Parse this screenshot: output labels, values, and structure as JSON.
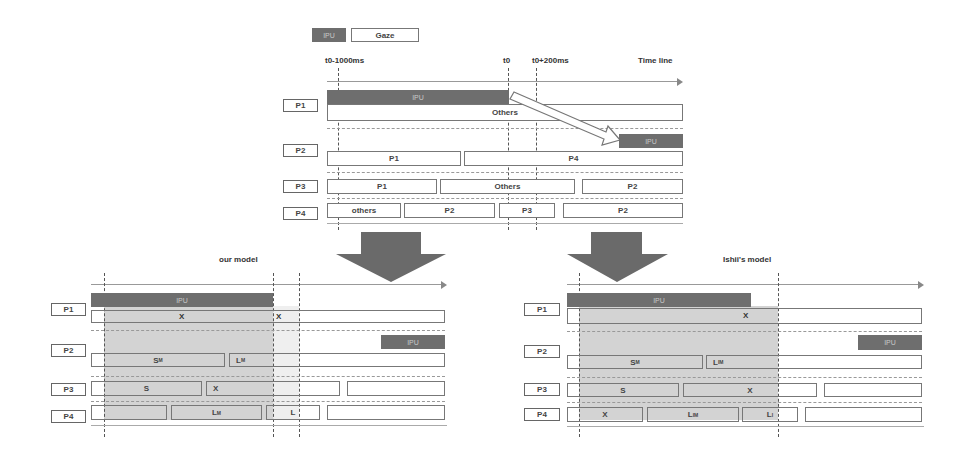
{
  "legend": {
    "ipu_label": "IPU",
    "gaze_label": "Gaze",
    "ipu_color": "#6e6e6e"
  },
  "top": {
    "time_labels": {
      "t_minus": "t0-1000ms",
      "t0": "t0",
      "t_plus": "t0+200ms",
      "timeline": "Time line"
    },
    "participants": [
      "P1",
      "P2",
      "P3",
      "P4"
    ],
    "ipu_label": "IPU",
    "rows": {
      "p1": [
        "Others"
      ],
      "p2": [
        "P1",
        "P4"
      ],
      "p3": [
        "P1",
        "Others",
        "P2"
      ],
      "p4": [
        "others",
        "P2",
        "P3",
        "P2"
      ]
    }
  },
  "our_model": {
    "title": "our model",
    "participants": [
      "P1",
      "P2",
      "P3",
      "P4"
    ],
    "ipu_label": "IPU",
    "rows": {
      "p1": [
        "X",
        "X"
      ],
      "p2": {
        "a": "S",
        "a_sub": "M",
        "b": "L",
        "b_sub": "M"
      },
      "p3": [
        "S",
        "X"
      ],
      "p4": {
        "b": "L",
        "b_sub": "M",
        "c": "L"
      }
    }
  },
  "ishii_model": {
    "title": "Ishii's model",
    "participants": [
      "P1",
      "P2",
      "P3",
      "P4"
    ],
    "ipu_label": "IPU",
    "rows": {
      "p1": [
        "X"
      ],
      "p2": {
        "a": "S",
        "a_sub": "M",
        "b": "L",
        "b_sub": "IM"
      },
      "p3": [
        "S",
        "X"
      ],
      "p4": {
        "a": "X",
        "b": "L",
        "b_sub": "IM",
        "c": "L",
        "c_sub": "I"
      }
    }
  }
}
